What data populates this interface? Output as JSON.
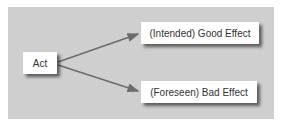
{
  "diagram": {
    "nodes": {
      "act": {
        "label": "Act"
      },
      "good": {
        "label": "(Intended) Good Effect"
      },
      "bad": {
        "label": "(Foreseen) Bad Effect"
      }
    },
    "edges": [
      {
        "from": "act",
        "to": "good"
      },
      {
        "from": "act",
        "to": "bad"
      }
    ],
    "colors": {
      "background": "#cfcfcf",
      "node": "#ffffff",
      "arrow": "#6b6b6b",
      "text": "#333333"
    }
  }
}
